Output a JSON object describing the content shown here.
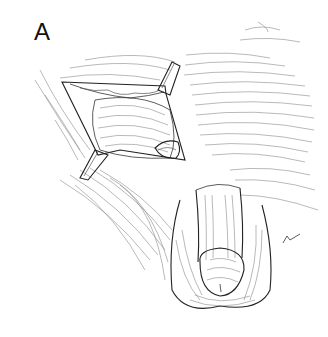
{
  "figure": {
    "panel_label": "A",
    "colors": {
      "background": "#ffffff",
      "ink": "#222222",
      "hatching": "#8a8a8a"
    }
  }
}
